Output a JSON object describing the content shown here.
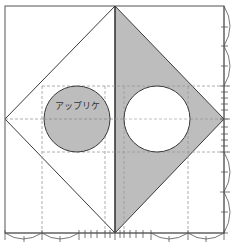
{
  "diagram": {
    "label_applique": "アップリケ",
    "colors": {
      "fill_gray": "#bdbdbd",
      "line": "#3a3a3a",
      "dash": "#9a9a9a",
      "background": "#ffffff"
    },
    "outer_square": {
      "x": 5,
      "y": 6,
      "w": 219,
      "h": 227
    },
    "diamond": {
      "top": [
        115,
        6
      ],
      "right": [
        224,
        119
      ],
      "bottom": [
        115,
        233
      ],
      "left": [
        5,
        119
      ]
    },
    "circles": [
      {
        "name": "applique-circle",
        "cx": 77,
        "cy": 119,
        "r": 33,
        "fill": "gray"
      },
      {
        "name": "cutout-circle",
        "cx": 157,
        "cy": 119,
        "r": 33,
        "fill": "white"
      }
    ],
    "dashed_horizontal_y": [
      86,
      119,
      152
    ],
    "dashed_vertical_x": [
      42,
      105,
      124,
      188
    ]
  }
}
